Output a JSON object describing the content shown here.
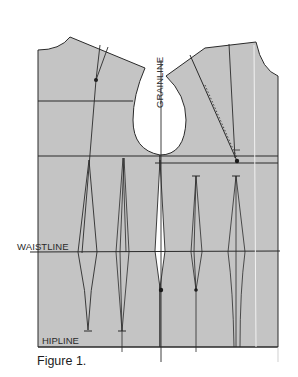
{
  "figure": {
    "caption": "Figure 1.",
    "colors": {
      "background": "#ffffff",
      "pattern_fill": "#c4c4c4",
      "line": "#2a2a2a",
      "highlight_line": "#f2f2f2"
    }
  },
  "labels": {
    "grainline": "GRAINLINE",
    "waistline": "WAISTLINE",
    "hipline": "HIPLINE"
  },
  "pieces": [
    {
      "name": "back-bodice",
      "side": "left"
    },
    {
      "name": "front-bodice",
      "side": "right"
    }
  ],
  "guide_lines": [
    {
      "name": "chest-line",
      "y": 101
    },
    {
      "name": "bust-line",
      "y": 156
    },
    {
      "name": "waistline",
      "y": 251
    },
    {
      "name": "hipline",
      "y": 347
    }
  ]
}
